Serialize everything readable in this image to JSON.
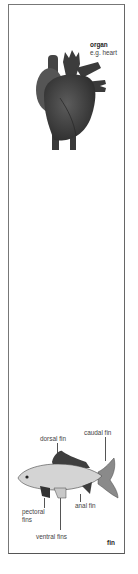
{
  "organ_panel": {
    "title": "organ",
    "example": "e.g. heart",
    "illustration": "heart-illustration"
  },
  "fin_panel": {
    "title": "fin",
    "illustration": "fish-illustration",
    "labels": {
      "dorsal": "dorsal fin",
      "caudal": "caudal fin",
      "anal": "anal fin",
      "pectoral_line1": "pectoral",
      "pectoral_line2": "fins",
      "ventral": "ventral fins"
    }
  },
  "colors": {
    "heart": "#4a4a4a",
    "fish_body": "#d4d4d4",
    "fins_dark": "#3e3e3e",
    "frame": "#777777"
  }
}
